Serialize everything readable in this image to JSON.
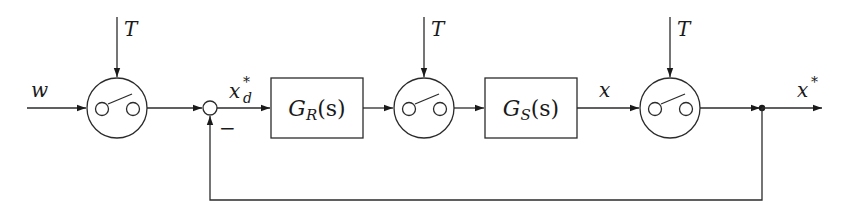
{
  "diagram": {
    "type": "sampled-data control loop block diagram",
    "signals": {
      "input": "w",
      "sampled_error_main": "x",
      "sampled_error_sub": "d",
      "sampled_error_sup": "*",
      "plant_output": "x",
      "output_main": "x",
      "output_sup": "*",
      "sample_period": "T",
      "feedback_sign": "−"
    },
    "blocks": [
      {
        "id": "controller",
        "main": "G",
        "sub": "R",
        "arg": "(s)"
      },
      {
        "id": "plant",
        "main": "G",
        "sub": "S",
        "arg": "(s)"
      }
    ],
    "samplers": [
      {
        "id": "sampler-1",
        "clock": "T"
      },
      {
        "id": "sampler-2",
        "clock": "T"
      },
      {
        "id": "sampler-3",
        "clock": "T"
      }
    ],
    "colors": {
      "stroke": "#2b2b2b",
      "background": "#ffffff"
    }
  }
}
